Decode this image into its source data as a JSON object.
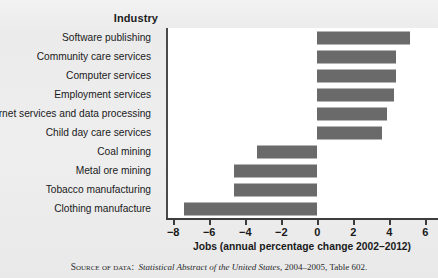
{
  "figure": {
    "industry_header": "Industry",
    "source_prefix": "Source of data:",
    "source_italic": "Statistical Abstract of the United States",
    "source_suffix": ", 2004–2005, Table 602."
  },
  "chart_data": {
    "type": "bar",
    "orientation": "horizontal",
    "title": "",
    "xlabel": "Jobs (annual percentage change 2002–2012)",
    "ylabel": "Industry",
    "categories": [
      "Software publishing",
      "Community care services",
      "Computer services",
      "Employment services",
      "Internet services and data processing",
      "Child day care services",
      "Coal mining",
      "Metal ore mining",
      "Tobacco manufacturing",
      "Clothing manufacture"
    ],
    "values": [
      5.2,
      4.4,
      4.4,
      4.3,
      3.9,
      3.6,
      -3.3,
      -4.6,
      -4.6,
      -7.4
    ],
    "xlim": [
      -8.4,
      6.7
    ],
    "xticks": [
      -8,
      -6,
      -4,
      -2,
      0,
      2,
      4,
      6
    ],
    "xticklabels": [
      "−8",
      "−6",
      "−4",
      "−2",
      "0",
      "2",
      "4",
      "6"
    ],
    "grid": false,
    "legend": false,
    "bar_color": "#6a6a6a",
    "plot_background": "#ffffff",
    "axis_color": "#3d3d3d"
  }
}
